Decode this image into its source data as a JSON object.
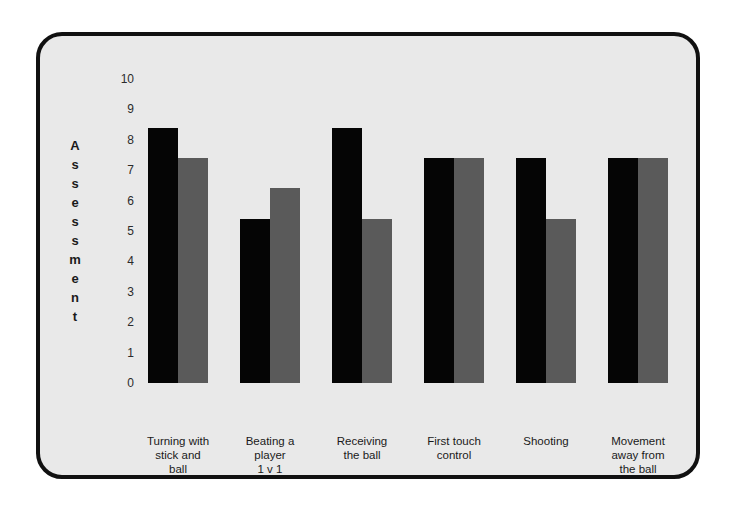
{
  "chart_data": {
    "type": "bar",
    "title": "",
    "xlabel": "",
    "ylabel": "Assessment",
    "ylim": [
      0,
      10
    ],
    "grid": false,
    "legend": "none",
    "y_ticks": [
      10,
      9,
      8,
      7,
      6,
      5,
      4,
      3,
      2,
      1,
      0
    ],
    "categories": [
      "Turning with stick and ball",
      "Beating a player 1 v 1",
      "Receiving the ball",
      "First touch control",
      "Shooting",
      "Movement away from the ball"
    ],
    "category_lines": [
      [
        "Turning with",
        "stick and",
        "ball"
      ],
      [
        "Beating a",
        "player",
        "1 v 1"
      ],
      [
        "Receiving",
        "the ball"
      ],
      [
        "First touch",
        "control"
      ],
      [
        "Shooting"
      ],
      [
        "Movement",
        "away from",
        "the ball"
      ]
    ],
    "series": [
      {
        "name": "Series 1",
        "color": "#050505",
        "values": [
          8.4,
          5.4,
          8.4,
          7.4,
          7.4,
          7.4
        ]
      },
      {
        "name": "Series 2",
        "color": "#5a5a5a",
        "values": [
          7.4,
          6.4,
          5.4,
          7.4,
          5.4,
          7.4
        ]
      }
    ]
  },
  "panel": {
    "background": "#e9e9e9",
    "border_color": "#111111"
  }
}
